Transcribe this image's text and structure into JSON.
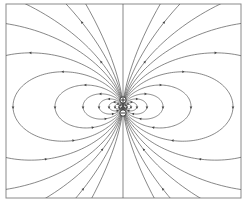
{
  "diagram": {
    "type": "field-lines",
    "frame": {
      "x": 6,
      "y": 4,
      "width": 235,
      "height": 194,
      "color": "#8a8a8a"
    },
    "line_color": "#555555",
    "charges": [
      {
        "name": "positive-charge",
        "sign": "+",
        "x": 123,
        "y": 100,
        "r": 3.2
      },
      {
        "name": "negative-charge",
        "sign": "-",
        "x": 123,
        "y": 113,
        "r": 3.2
      }
    ],
    "dipole_center": {
      "x": 123,
      "y": 106.5
    },
    "loop_scales": [
      4,
      8,
      14,
      24,
      40,
      68,
      110,
      170,
      270
    ],
    "open_line_count": 6
  }
}
